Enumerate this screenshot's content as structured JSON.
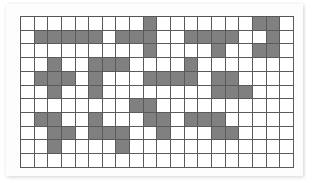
{
  "grid": {
    "rows": 11,
    "cols": 20,
    "colors": {
      "filled": "#808080",
      "empty": "#ffffff",
      "line": "#5a5a5a"
    },
    "filled_cells": [
      [
        9,
        17,
        18
      ],
      [
        1,
        2,
        3,
        4,
        5,
        7,
        8,
        9,
        12,
        13,
        14,
        15,
        18
      ],
      [
        9,
        14,
        17,
        18
      ],
      [
        2,
        5,
        6,
        7,
        12
      ],
      [
        1,
        2,
        3,
        5,
        9,
        10,
        11,
        12,
        14,
        15
      ],
      [
        2,
        5,
        14,
        15,
        16
      ],
      [
        8,
        9
      ],
      [
        1,
        2,
        5,
        9,
        10,
        12,
        13,
        14
      ],
      [
        2,
        3,
        5,
        6,
        7,
        10,
        14,
        15
      ],
      [
        2,
        7
      ],
      []
    ]
  }
}
